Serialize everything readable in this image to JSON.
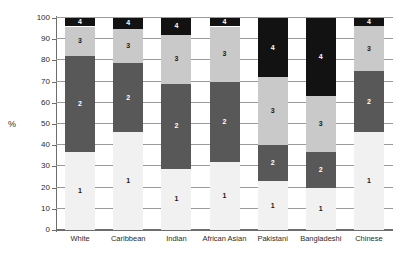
{
  "chart_data": {
    "type": "bar",
    "subtype": "stacked-bar-100",
    "title": "",
    "xlabel": "",
    "ylabel": "%",
    "ylim": [
      0,
      100
    ],
    "yticks": [
      0,
      10,
      20,
      30,
      40,
      50,
      60,
      70,
      80,
      90,
      100
    ],
    "ytick_labels": [
      "0",
      "10",
      "20",
      "30",
      "40",
      "50",
      "60",
      "70",
      "80",
      "90",
      "100"
    ],
    "grid": true,
    "legend": "none",
    "categories": [
      "White",
      "Caribbean",
      "Indian",
      "African Asian",
      "Pakistani",
      "Bangladeshi",
      "Chinese"
    ],
    "series": [
      {
        "name": "1",
        "label": "1",
        "color": "#f1f1f1",
        "values": [
          37,
          46,
          29,
          32,
          23,
          20,
          46
        ]
      },
      {
        "name": "2",
        "label": "2",
        "color": "#585858",
        "values": [
          45,
          33,
          40,
          38,
          17,
          17,
          29
        ]
      },
      {
        "name": "3",
        "label": "3",
        "color": "#c9c9c9",
        "values": [
          14,
          16,
          23,
          26,
          32,
          26,
          21
        ]
      },
      {
        "name": "4",
        "label": "4",
        "color": "#121212",
        "values": [
          4,
          5,
          8,
          4,
          28,
          37,
          4
        ]
      }
    ],
    "cumulative_tops": [
      [
        37,
        82,
        96,
        100
      ],
      [
        46,
        79,
        95,
        100
      ],
      [
        29,
        69,
        92,
        100
      ],
      [
        32,
        70,
        96,
        100
      ],
      [
        23,
        40,
        72,
        100
      ],
      [
        20,
        37,
        63,
        100
      ],
      [
        46,
        75,
        96,
        100
      ]
    ],
    "segment_data_labels": [
      [
        "1",
        "2",
        "3",
        "4"
      ],
      [
        "1",
        "2",
        "3",
        "4"
      ],
      [
        "1",
        "2",
        "3",
        "4"
      ],
      [
        "1",
        "2",
        "3",
        "4"
      ],
      [
        "1",
        "2",
        "3",
        "4"
      ],
      [
        "1",
        "2",
        "3",
        "4"
      ],
      [
        "1",
        "2",
        "3",
        "4"
      ]
    ]
  },
  "colors": {
    "segment_1": "#f1f1f1",
    "segment_2": "#585858",
    "segment_3": "#c9c9c9",
    "segment_4": "#121212",
    "gridline": "#9a9a9a",
    "axis": "#6d6d6d",
    "text": "#2b2b2b",
    "background": "#ffffff"
  }
}
